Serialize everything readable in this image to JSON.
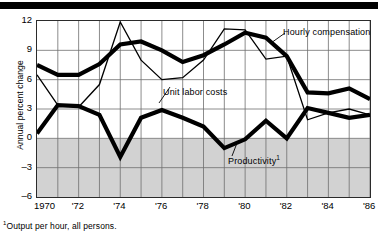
{
  "figure": {
    "ylabel": "Annual percent change",
    "footnote_marker": "1",
    "footnote": "Output per hour, all persons."
  },
  "annotations": {
    "hourly_compensation": "Hourly compensation",
    "unit_labor_costs": "Unit labor costs",
    "productivity": "Productivity",
    "productivity_marker": "1"
  },
  "chart_data": {
    "type": "line",
    "title": "",
    "xlabel": "",
    "ylabel": "Annual percent change",
    "xlim": [
      1970,
      1986
    ],
    "ylim": [
      -6,
      12
    ],
    "yticks": [
      12,
      9,
      6,
      3,
      0,
      -3,
      -6
    ],
    "ytick_labels": [
      "12",
      "9",
      "6",
      "3",
      "0",
      "-3",
      "-6"
    ],
    "xticks": [
      1970,
      1971,
      1972,
      1973,
      1974,
      1975,
      1976,
      1977,
      1978,
      1979,
      1980,
      1981,
      1982,
      1983,
      1984,
      1985,
      1986
    ],
    "xtick_labels": [
      "1970",
      "",
      "'72",
      "",
      "'74",
      "",
      "'76",
      "",
      "'78",
      "",
      "'80",
      "",
      "'82",
      "",
      "'84",
      "",
      "'86"
    ],
    "grid": true,
    "grid_color": "#6e6e6e",
    "negative_shading": true,
    "negative_shading_color": "#d2d2d2",
    "legend": "inline-annotations",
    "x": [
      1970,
      1971,
      1972,
      1973,
      1974,
      1975,
      1976,
      1977,
      1978,
      1979,
      1980,
      1981,
      1982,
      1983,
      1984,
      1985,
      1986
    ],
    "series": [
      {
        "name": "Hourly compensation",
        "style": "thick",
        "color": "#000000",
        "width": 4.2,
        "values": [
          7.5,
          6.5,
          6.5,
          7.6,
          9.6,
          9.9,
          9.0,
          7.8,
          8.5,
          9.6,
          10.8,
          10.3,
          8.4,
          4.7,
          4.6,
          5.1,
          4.0
        ]
      },
      {
        "name": "Unit labor costs",
        "style": "thin",
        "color": "#000000",
        "width": 1.3,
        "values": [
          6.5,
          3.4,
          3.2,
          5.5,
          11.9,
          8.0,
          6.0,
          6.2,
          8.0,
          11.2,
          11.1,
          8.1,
          8.4,
          1.9,
          2.6,
          3.0,
          2.4
        ]
      },
      {
        "name": "Productivity",
        "style": "thick",
        "color": "#000000",
        "width": 4.2,
        "values": [
          0.5,
          3.4,
          3.3,
          2.4,
          -1.9,
          2.1,
          2.9,
          2.1,
          1.2,
          -1.0,
          -0.1,
          1.8,
          0.0,
          3.1,
          2.6,
          2.1,
          2.4
        ]
      }
    ]
  }
}
